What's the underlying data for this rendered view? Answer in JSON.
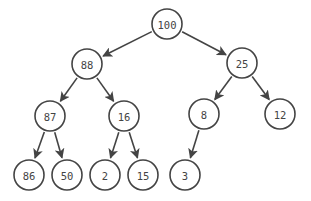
{
  "diagram": {
    "type": "binary-max-heap-tree",
    "style": {
      "stroke": "#444444",
      "fill": "#ffffff",
      "text": "#444444",
      "radius": 15
    },
    "nodes": [
      {
        "id": "n0",
        "label": "100",
        "x": 167,
        "y": 24
      },
      {
        "id": "n1",
        "label": "88",
        "x": 87,
        "y": 64
      },
      {
        "id": "n2",
        "label": "25",
        "x": 242,
        "y": 63
      },
      {
        "id": "n3",
        "label": "87",
        "x": 50,
        "y": 116
      },
      {
        "id": "n4",
        "label": "16",
        "x": 124,
        "y": 116
      },
      {
        "id": "n5",
        "label": "8",
        "x": 204,
        "y": 114
      },
      {
        "id": "n6",
        "label": "12",
        "x": 280,
        "y": 114
      },
      {
        "id": "n7",
        "label": "86",
        "x": 29,
        "y": 175
      },
      {
        "id": "n8",
        "label": "50",
        "x": 67,
        "y": 175
      },
      {
        "id": "n9",
        "label": "2",
        "x": 105,
        "y": 175
      },
      {
        "id": "n10",
        "label": "15",
        "x": 143,
        "y": 175
      },
      {
        "id": "n11",
        "label": "3",
        "x": 185,
        "y": 175
      }
    ],
    "edges": [
      {
        "from": "n0",
        "to": "n1"
      },
      {
        "from": "n0",
        "to": "n2"
      },
      {
        "from": "n1",
        "to": "n3"
      },
      {
        "from": "n1",
        "to": "n4"
      },
      {
        "from": "n2",
        "to": "n5"
      },
      {
        "from": "n2",
        "to": "n6"
      },
      {
        "from": "n3",
        "to": "n7"
      },
      {
        "from": "n3",
        "to": "n8"
      },
      {
        "from": "n4",
        "to": "n9"
      },
      {
        "from": "n4",
        "to": "n10"
      },
      {
        "from": "n5",
        "to": "n11"
      }
    ]
  }
}
